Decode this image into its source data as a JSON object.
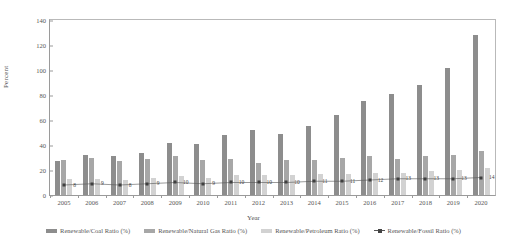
{
  "chart_data": {
    "type": "bar",
    "title": "",
    "xlabel": "Year",
    "ylabel": "Percent",
    "ylim": [
      0,
      140
    ],
    "yticks": [
      0,
      20,
      40,
      60,
      80,
      100,
      120,
      140
    ],
    "grid": false,
    "legend_position": "bottom",
    "categories": [
      "2005",
      "2006",
      "2007",
      "2008",
      "2009",
      "2010",
      "2011",
      "2012",
      "2013",
      "2014",
      "2015",
      "2016",
      "2017",
      "2018",
      "2019",
      "2020"
    ],
    "series": [
      {
        "name": "Renewable/Coal Ratio (%)",
        "type": "bar",
        "color": "#8d8d8d",
        "values": [
          27,
          32,
          31,
          34,
          42,
          41,
          48,
          52,
          49,
          55,
          64,
          75,
          81,
          88,
          102,
          128
        ]
      },
      {
        "name": "Renewable/Natural Gas Ratio (%)",
        "type": "bar",
        "color": "#a7a7a7",
        "values": [
          28,
          30,
          27,
          29,
          31,
          28,
          29,
          26,
          28,
          28,
          30,
          31,
          29,
          31,
          32,
          35
        ]
      },
      {
        "name": "Renewable/Petroleum Ratio (%)",
        "type": "bar",
        "color": "#d2d2d2",
        "values": [
          13,
          13,
          12,
          14,
          15,
          14,
          16,
          16,
          16,
          17,
          17,
          18,
          18,
          19,
          20,
          22
        ]
      },
      {
        "name": "Renewable/Fossil Ratio (%)",
        "type": "line",
        "color": "#555555",
        "values": [
          8,
          9,
          8,
          9,
          10,
          9,
          10,
          10,
          10,
          11,
          11,
          12,
          13,
          13,
          13,
          14
        ],
        "labels": [
          "8",
          "9",
          "8",
          "9",
          "10",
          "9",
          "10",
          "10",
          "10",
          "11",
          "11",
          "12",
          "13",
          "13",
          "13",
          "14"
        ]
      }
    ]
  },
  "legend": {
    "items": [
      {
        "label": "Renewable/Coal Ratio  (%)",
        "kind": "coal"
      },
      {
        "label": "Renewable/Natural Gas Ratio  (%)",
        "kind": "gas"
      },
      {
        "label": "Renewable/Petroleum Ratio  (%)",
        "kind": "petrol"
      },
      {
        "label": "Renewable/Fossil Ratio  (%)",
        "kind": "line"
      }
    ]
  }
}
